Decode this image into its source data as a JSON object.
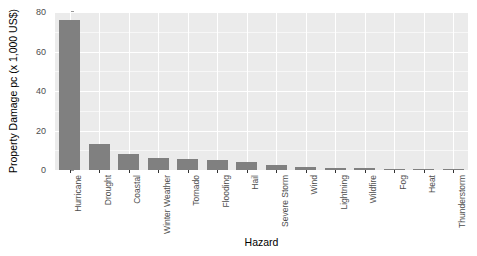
{
  "chart_data": {
    "type": "bar",
    "title": "",
    "xlabel": "Hazard",
    "ylabel": "Property Damage pc (x 1,000 US$)",
    "ylim": [
      0,
      80
    ],
    "yticks": [
      0,
      20,
      40,
      60,
      80
    ],
    "ytick_labels": [
      "0",
      "20",
      "40",
      "60",
      "80"
    ],
    "yminor": [
      10,
      30,
      50,
      70
    ],
    "grid": true,
    "legend": "none",
    "bar_color": "#808080",
    "panel_color": "#ebebeb",
    "gridline_color": "#ffffff",
    "categories": [
      "Hurricane",
      "Drought",
      "Coastal",
      "Winter Weather",
      "Tornado",
      "Flooding",
      "Hail",
      "Severe Storm",
      "Wind",
      "Lightning",
      "Wildfire",
      "Fog",
      "Heat",
      "Thunderstorm"
    ],
    "values": [
      76,
      13,
      8,
      6,
      5.5,
      5,
      4,
      2.5,
      1.5,
      1,
      0.8,
      0.5,
      0.3,
      0.2
    ]
  }
}
